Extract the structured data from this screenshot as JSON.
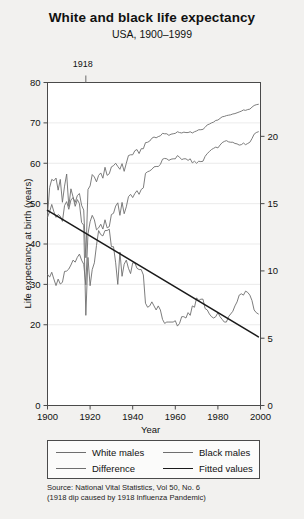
{
  "chart_data": {
    "type": "line",
    "title": "White and black life expectancy",
    "subtitle": "USA, 1900–1999",
    "xlabel": "Year",
    "ylabel": "Life expectancy at birth (years)",
    "xlim": [
      1900,
      2000
    ],
    "ylim": [
      0,
      80
    ],
    "y2lim": [
      0,
      24
    ],
    "grid": true,
    "legend_position": "below-axis",
    "xticks": [
      1900,
      1920,
      1940,
      1960,
      1980,
      2000
    ],
    "xticklabels": [
      "1900",
      "1920",
      "1940",
      "1960",
      "1980",
      "2000"
    ],
    "yticks": [
      0,
      20,
      30,
      40,
      50,
      60,
      70,
      80
    ],
    "yticklabels": [
      "0",
      "20",
      "30",
      "40",
      "50",
      "60",
      "70",
      "80"
    ],
    "y2ticks": [
      0,
      5,
      10,
      15,
      20
    ],
    "y2ticklabels": [
      "0",
      "5",
      "10",
      "15",
      "20"
    ],
    "annotations": [
      {
        "label": "1918",
        "x": 1918,
        "type": "top-axis-tick"
      }
    ],
    "series": [
      {
        "name": "White males",
        "axis": "left",
        "x": [
          1900,
          1901,
          1902,
          1903,
          1904,
          1905,
          1906,
          1907,
          1908,
          1909,
          1910,
          1911,
          1912,
          1913,
          1914,
          1915,
          1916,
          1917,
          1918,
          1919,
          1920,
          1921,
          1922,
          1923,
          1924,
          1925,
          1926,
          1927,
          1928,
          1929,
          1930,
          1931,
          1932,
          1933,
          1934,
          1935,
          1936,
          1937,
          1938,
          1939,
          1940,
          1941,
          1942,
          1943,
          1944,
          1945,
          1946,
          1947,
          1948,
          1949,
          1950,
          1951,
          1952,
          1953,
          1954,
          1955,
          1956,
          1957,
          1958,
          1959,
          1960,
          1961,
          1962,
          1963,
          1964,
          1965,
          1966,
          1967,
          1968,
          1969,
          1970,
          1971,
          1972,
          1973,
          1974,
          1975,
          1976,
          1977,
          1978,
          1979,
          1980,
          1981,
          1982,
          1983,
          1984,
          1985,
          1986,
          1987,
          1988,
          1989,
          1990,
          1991,
          1992,
          1993,
          1994,
          1995,
          1996,
          1997,
          1998,
          1999
        ],
        "y": [
          46.6,
          48.0,
          49.8,
          48.0,
          46.6,
          47.3,
          46.9,
          45.6,
          49.5,
          50.5,
          48.6,
          50.9,
          51.5,
          50.3,
          52.0,
          52.5,
          49.6,
          48.4,
          36.6,
          53.5,
          54.4,
          57.2,
          56.6,
          55.4,
          57.0,
          57.6,
          56.3,
          59.0,
          57.0,
          57.4,
          59.1,
          59.4,
          60.0,
          59.2,
          58.5,
          59.9,
          58.0,
          60.0,
          61.9,
          62.1,
          62.1,
          63.1,
          63.4,
          62.4,
          63.6,
          63.6,
          65.1,
          65.2,
          65.5,
          66.2,
          66.5,
          66.3,
          66.6,
          66.8,
          67.4,
          67.3,
          67.3,
          66.9,
          67.2,
          67.3,
          67.4,
          67.8,
          67.6,
          67.5,
          67.7,
          67.6,
          67.6,
          67.8,
          67.5,
          67.8,
          68.0,
          68.3,
          68.3,
          68.4,
          68.9,
          69.5,
          69.7,
          70.0,
          70.2,
          70.6,
          70.7,
          71.1,
          71.5,
          71.6,
          71.8,
          71.9,
          72.0,
          72.2,
          72.3,
          72.5,
          72.7,
          72.9,
          73.2,
          73.1,
          73.3,
          73.4,
          73.9,
          74.3,
          74.5,
          74.6
        ]
      },
      {
        "name": "Black males",
        "axis": "left",
        "x": [
          1900,
          1901,
          1902,
          1903,
          1904,
          1905,
          1906,
          1907,
          1908,
          1909,
          1910,
          1911,
          1912,
          1913,
          1914,
          1915,
          1916,
          1917,
          1918,
          1919,
          1920,
          1921,
          1922,
          1923,
          1924,
          1925,
          1926,
          1927,
          1928,
          1929,
          1930,
          1931,
          1932,
          1933,
          1934,
          1935,
          1936,
          1937,
          1938,
          1939,
          1940,
          1941,
          1942,
          1943,
          1944,
          1945,
          1946,
          1947,
          1948,
          1949,
          1950,
          1951,
          1952,
          1953,
          1954,
          1955,
          1956,
          1957,
          1958,
          1959,
          1960,
          1961,
          1962,
          1963,
          1964,
          1965,
          1966,
          1967,
          1968,
          1969,
          1970,
          1971,
          1972,
          1973,
          1974,
          1975,
          1976,
          1977,
          1978,
          1979,
          1980,
          1981,
          1982,
          1983,
          1984,
          1985,
          1986,
          1987,
          1988,
          1989,
          1990,
          1991,
          1992,
          1993,
          1994,
          1995,
          1996,
          1997,
          1998,
          1999
        ],
        "y": [
          32.5,
          31.8,
          33.0,
          31.3,
          29.7,
          31.3,
          30.1,
          30.5,
          33.2,
          33.3,
          33.8,
          34.8,
          36.0,
          35.5,
          36.7,
          37.5,
          36.0,
          35.0,
          29.9,
          42.5,
          45.5,
          47.1,
          46.0,
          43.5,
          44.0,
          44.9,
          43.7,
          46.0,
          44.0,
          44.3,
          47.3,
          47.6,
          49.4,
          50.2,
          47.1,
          50.3,
          47.5,
          49.2,
          51.7,
          52.3,
          51.5,
          52.5,
          53.2,
          52.3,
          53.5,
          53.9,
          57.5,
          57.9,
          58.1,
          58.5,
          59.1,
          59.2,
          59.2,
          59.7,
          61.0,
          61.2,
          61.1,
          60.7,
          61.0,
          61.1,
          61.1,
          61.9,
          61.5,
          60.9,
          61.1,
          61.1,
          60.7,
          61.1,
          60.1,
          60.5,
          60.0,
          60.5,
          60.4,
          60.5,
          61.7,
          62.4,
          62.9,
          63.4,
          63.7,
          64.0,
          63.8,
          64.5,
          65.1,
          65.4,
          65.6,
          65.3,
          65.2,
          65.2,
          64.9,
          64.8,
          64.5,
          64.6,
          65.0,
          64.6,
          64.9,
          65.2,
          66.1,
          67.2,
          67.6,
          67.8
        ]
      },
      {
        "name": "Difference",
        "axis": "right",
        "x": [
          1900,
          1901,
          1902,
          1903,
          1904,
          1905,
          1906,
          1907,
          1908,
          1909,
          1910,
          1911,
          1912,
          1913,
          1914,
          1915,
          1916,
          1917,
          1918,
          1919,
          1920,
          1921,
          1922,
          1923,
          1924,
          1925,
          1926,
          1927,
          1928,
          1929,
          1930,
          1931,
          1932,
          1933,
          1934,
          1935,
          1936,
          1937,
          1938,
          1939,
          1940,
          1941,
          1942,
          1943,
          1944,
          1945,
          1946,
          1947,
          1948,
          1949,
          1950,
          1951,
          1952,
          1953,
          1954,
          1955,
          1956,
          1957,
          1958,
          1959,
          1960,
          1961,
          1962,
          1963,
          1964,
          1965,
          1966,
          1967,
          1968,
          1969,
          1970,
          1971,
          1972,
          1973,
          1974,
          1975,
          1976,
          1977,
          1978,
          1979,
          1980,
          1981,
          1982,
          1983,
          1984,
          1985,
          1986,
          1987,
          1988,
          1989,
          1990,
          1991,
          1992,
          1993,
          1994,
          1995,
          1996,
          1997,
          1998,
          1999
        ],
        "y": [
          14.1,
          16.2,
          16.8,
          16.7,
          16.9,
          16.0,
          16.8,
          15.1,
          16.3,
          17.2,
          14.8,
          16.1,
          15.5,
          14.8,
          15.3,
          15.0,
          13.6,
          13.4,
          6.7,
          11.0,
          8.9,
          10.1,
          10.6,
          11.9,
          13.0,
          12.7,
          12.6,
          13.0,
          13.0,
          13.1,
          11.8,
          11.8,
          10.6,
          9.0,
          11.4,
          9.6,
          10.5,
          10.8,
          10.2,
          9.8,
          10.6,
          10.6,
          10.2,
          10.1,
          10.1,
          9.7,
          7.6,
          7.3,
          7.4,
          7.7,
          7.4,
          7.1,
          7.4,
          7.1,
          6.4,
          6.1,
          6.2,
          6.2,
          6.2,
          6.2,
          6.3,
          5.9,
          6.1,
          6.6,
          6.6,
          6.5,
          6.9,
          6.7,
          7.4,
          7.3,
          8.0,
          7.8,
          7.9,
          7.9,
          7.2,
          7.1,
          6.8,
          6.6,
          6.5,
          6.6,
          6.9,
          6.6,
          6.4,
          6.2,
          6.2,
          6.6,
          6.8,
          7.0,
          7.4,
          7.7,
          8.2,
          8.3,
          8.2,
          8.5,
          8.4,
          8.2,
          7.8,
          7.1,
          6.9,
          6.8
        ]
      },
      {
        "name": "Fitted values",
        "axis": "right",
        "x": [
          1900,
          1999
        ],
        "y": [
          14.5,
          5.1
        ]
      }
    ]
  },
  "legend": {
    "entries": [
      {
        "label": "White males",
        "style": "thin"
      },
      {
        "label": "Black males",
        "style": "thin"
      },
      {
        "label": "Difference",
        "style": "thin"
      },
      {
        "label": "Fitted values",
        "style": "thick"
      }
    ]
  },
  "footnote": {
    "line1": "Source: National Vital Statistics, Vol 50, No. 6",
    "line2": "(1918 dip caused by 1918 Influenza Pandemic)"
  },
  "colors": {
    "background": "#f2f1ef",
    "plot_background": "#ffffff",
    "axis": "#4a4a4a",
    "grid": "#e6e6e6",
    "series_line": "#6e6e6e",
    "fitted_line": "#1a1a1a",
    "text": "#111111"
  }
}
